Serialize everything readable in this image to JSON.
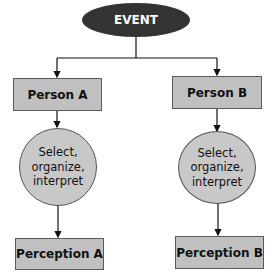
{
  "diagram": {
    "event": {
      "label": "EVENT"
    },
    "person_a": {
      "label": "Person A"
    },
    "person_b": {
      "label": "Person B"
    },
    "process_a": {
      "label": "Select,\norganize,\ninterpret"
    },
    "process_b": {
      "label": "Select,\norganize,\ninterpret"
    },
    "perception_a": {
      "label": "Perception A"
    },
    "perception_b": {
      "label": "Perception B"
    }
  },
  "colors": {
    "event_fill": "#333333",
    "box_fill": "#c0c0c0",
    "circle_fill": "#c8c8c8",
    "line": "#111111"
  }
}
